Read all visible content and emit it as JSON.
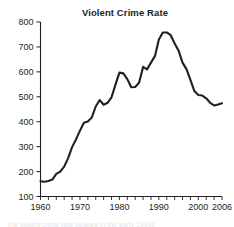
{
  "chart_data": {
    "type": "line",
    "title": "Violent Crime Rate",
    "xlabel": "",
    "ylabel": "",
    "xlim": [
      1960,
      2006
    ],
    "ylim": [
      100,
      800
    ],
    "grid": false,
    "legend": null,
    "x_tick_labels": [
      "1960",
      "1970",
      "1980",
      "1990",
      "2000",
      "2006"
    ],
    "x_tick_values": [
      1960,
      1970,
      1980,
      1990,
      2000,
      2006
    ],
    "y_tick_labels": [
      "100",
      "200",
      "300",
      "400",
      "500",
      "600",
      "700",
      "800"
    ],
    "y_tick_values": [
      100,
      200,
      300,
      400,
      500,
      600,
      700,
      800
    ],
    "x_minor_tick_step": 2,
    "series": [
      {
        "name": "Violent Crime Rate",
        "color": "#231f20",
        "x": [
          1960,
          1961,
          1962,
          1963,
          1964,
          1965,
          1966,
          1967,
          1968,
          1969,
          1970,
          1971,
          1972,
          1973,
          1974,
          1975,
          1976,
          1977,
          1978,
          1979,
          1980,
          1981,
          1982,
          1983,
          1984,
          1985,
          1986,
          1987,
          1988,
          1989,
          1990,
          1991,
          1992,
          1993,
          1994,
          1995,
          1996,
          1997,
          1998,
          1999,
          2000,
          2001,
          2002,
          2003,
          2004,
          2005,
          2006
        ],
        "values": [
          161,
          159,
          162,
          168,
          191,
          200,
          220,
          254,
          298,
          329,
          364,
          396,
          401,
          417,
          461,
          487,
          468,
          476,
          498,
          549,
          597,
          594,
          571,
          538,
          539,
          557,
          620,
          610,
          637,
          663,
          730,
          758,
          758,
          747,
          714,
          685,
          637,
          611,
          568,
          523,
          507,
          505,
          494,
          476,
          465,
          469,
          474
        ]
      }
    ]
  },
  "footer": {
    "partial_text": "the violent crime rate peaked in the early 1990s"
  }
}
